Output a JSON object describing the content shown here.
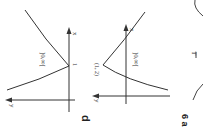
{
  "figure": {
    "rotation_deg": 90,
    "graph1": {
      "axis_x_label": "x",
      "axis_y_label": "y",
      "tick_label": "1",
      "domain_label": "]0,∞["
    },
    "graph2": {
      "axis_x_label": "x",
      "axis_y_label": "y",
      "point_label": "(1, 2)",
      "domain_label": "]0,∞["
    },
    "part_label": "d",
    "exercise_label": "6 a",
    "graph3": {
      "tick_label": "T"
    }
  }
}
